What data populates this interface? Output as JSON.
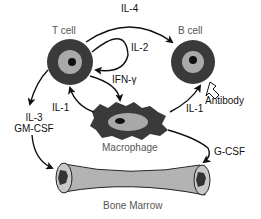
{
  "diagram": {
    "cells": {
      "t_cell": {
        "label": "T cell"
      },
      "b_cell": {
        "label": "B cell"
      },
      "macrophage": {
        "label": "Macrophage"
      },
      "bone_marrow": {
        "label": "Bone Marrow"
      }
    },
    "outputs": {
      "antibody": {
        "label": "Antibody"
      }
    },
    "signals": {
      "il4": "IL-4",
      "il2": "IL-2",
      "ifn_gamma": "IFN-γ",
      "il1_left": "IL-1",
      "il1_right": "IL-1",
      "il3": "IL-3",
      "gm_csf": "GM-CSF",
      "g_csf": "G-CSF"
    },
    "colors": {
      "cell_dark": "#3a3a3a",
      "cell_light": "#a9a9a9",
      "nucleus": "#111111",
      "bone_fill": "#b3b3b3",
      "arrow": "#111111"
    }
  }
}
